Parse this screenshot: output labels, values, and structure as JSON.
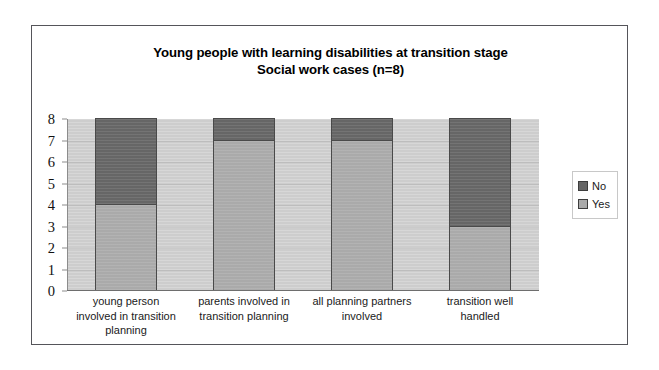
{
  "chart_data": {
    "type": "bar",
    "subtype": "stacked-bar",
    "title": "Young people with learning disabilities at transition stage",
    "subtitle": "Social work cases (n=8)",
    "xlabel": "",
    "ylabel": "",
    "ylim": [
      0,
      8
    ],
    "ytick_labels": [
      "8",
      "7",
      "6",
      "5",
      "4",
      "3",
      "2",
      "1",
      "0"
    ],
    "ytick_values": [
      8,
      7,
      6,
      5,
      4,
      3,
      2,
      1,
      0
    ],
    "grid": true,
    "grid_axis": "y",
    "legend_position": "right",
    "categories": [
      "young person involved in transition planning",
      "parents involved in transition planning",
      "all planning partners involved",
      "transition well handled"
    ],
    "category_lines": [
      [
        "young person",
        "involved in transition",
        "planning"
      ],
      [
        "parents involved in",
        "transition planning"
      ],
      [
        "all planning partners",
        "involved"
      ],
      [
        "transition well",
        "handled"
      ]
    ],
    "series": [
      {
        "name": "Yes",
        "color": "#aaaaaa",
        "values": [
          4,
          7,
          7,
          3
        ]
      },
      {
        "name": "No",
        "color": "#666666",
        "values": [
          4,
          1,
          1,
          5
        ]
      }
    ],
    "stack_order_bottom_to_top": [
      "Yes",
      "No"
    ],
    "totals": [
      8,
      8,
      8,
      8
    ],
    "plot_background": "#cdcdcd",
    "figure_background": "#ffffff",
    "border_color": "#55555a"
  },
  "legend": {
    "entries": [
      {
        "label": "No",
        "swatch_class": "sw-no"
      },
      {
        "label": "Yes",
        "swatch_class": "sw-yes"
      }
    ]
  }
}
